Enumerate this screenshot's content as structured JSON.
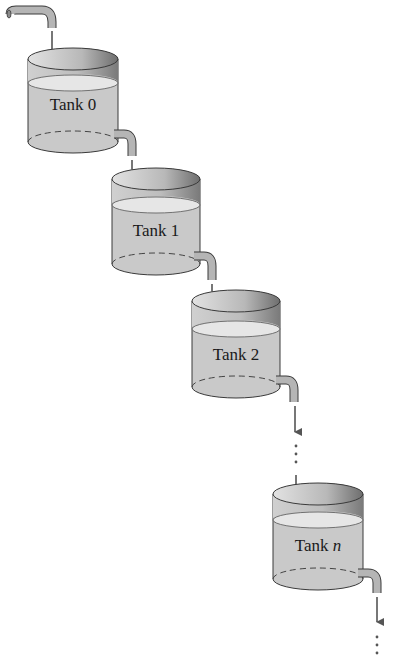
{
  "diagram": {
    "colors": {
      "wall": "#c9c9c9",
      "water_surface": "#e6e6e6",
      "inner_back": "#d8d8d8",
      "inner_dark": "#8a8a8a",
      "pipe": "#b5b5b5",
      "outline": "#3a3a3a",
      "arrow": "#555555",
      "background": "#ffffff"
    },
    "tanks": [
      {
        "label_prefix": "Tank ",
        "label_index": "0",
        "italic": false
      },
      {
        "label_prefix": "Tank ",
        "label_index": "1",
        "italic": false
      },
      {
        "label_prefix": "Tank ",
        "label_index": "2",
        "italic": false
      },
      {
        "label_prefix": "Tank ",
        "label_index": "n",
        "italic": true
      }
    ],
    "ellipsis": "⋮"
  }
}
